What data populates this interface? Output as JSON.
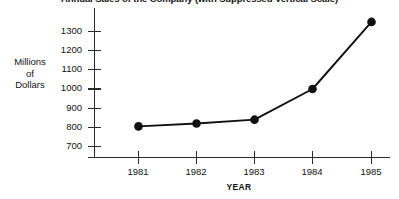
{
  "chart_data": {
    "type": "line",
    "title": "Annual Sales of the Company (with Suppressed Vertical Scale)",
    "xlabel": "YEAR",
    "ylabel": "Millions of Dollars",
    "ylabel_lines": [
      "Millions",
      "of",
      "Dollars"
    ],
    "categories": [
      "1981",
      "1982",
      "1983",
      "1984",
      "1985"
    ],
    "x": [
      1981,
      1982,
      1983,
      1984,
      1985
    ],
    "values": [
      805,
      820,
      840,
      1000,
      1350
    ],
    "series": [
      {
        "name": "Annual Sales",
        "values": [
          805,
          820,
          840,
          1000,
          1350
        ]
      }
    ],
    "yticks": [
      700,
      800,
      900,
      1000,
      1100,
      1200,
      1300
    ],
    "ytick_labels": [
      "700",
      "800",
      "900",
      "1000",
      "1100",
      "1200",
      "1300"
    ],
    "xtick_labels": [
      "1981",
      "1982",
      "1983",
      "1984",
      "1985"
    ],
    "ylim": [
      650,
      1390
    ],
    "xlim": [
      1980.6,
      1985.35
    ],
    "grid": false,
    "legend": false,
    "legend_position": "none",
    "marker": "circle",
    "line_color": "#111111",
    "marker_color": "#111111",
    "axis_color": "#2b2b2b",
    "background_color": "#ffffff",
    "annotations": []
  }
}
